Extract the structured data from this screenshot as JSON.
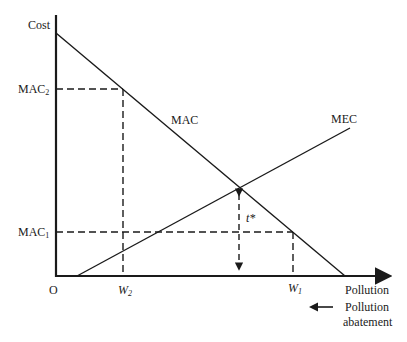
{
  "diagram": {
    "type": "economics-pollution-tax",
    "axes": {
      "y_label": "Cost",
      "x_label": "Pollution",
      "origin_label": "O",
      "secondary_direction_label_line1": "Pollution",
      "secondary_direction_label_line2": "abatement"
    },
    "curves": {
      "mac_label": "MAC",
      "mec_label": "MEC"
    },
    "levels": {
      "mac2_label": "MAC",
      "mac2_sub": "2",
      "mac1_label": "MAC",
      "mac1_sub": "1",
      "w2_label": "W",
      "w2_sub": "2",
      "w1_label": "W",
      "w1_sub": "1",
      "tax_label": "t*"
    },
    "colors": {
      "ink": "#1a1a1a",
      "background": "#ffffff"
    }
  }
}
